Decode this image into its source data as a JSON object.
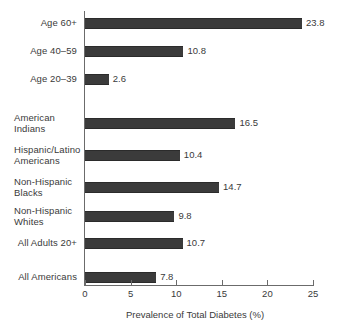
{
  "chart_data": {
    "type": "bar",
    "orientation": "horizontal",
    "title": "",
    "xlabel": "Prevalence of Total Diabetes (%)",
    "ylabel": "",
    "xlim": [
      0,
      25
    ],
    "xticks": [
      0,
      5,
      10,
      15,
      20,
      25
    ],
    "grid": false,
    "legend": false,
    "bar_color": "#3b3b3b",
    "categories": [
      "Age 60+",
      "Age 40–59",
      "Age 20–39",
      "American Indians",
      "Hispanic/Latino Americans",
      "Non-Hispanic Blacks",
      "Non-Hispanic Whites",
      "All Adults 20+",
      "All Americans"
    ],
    "values": [
      23.8,
      10.8,
      2.6,
      16.5,
      10.4,
      14.7,
      9.8,
      10.7,
      7.8
    ],
    "data_labels": [
      "23.8",
      "10.8",
      "2.6",
      "16.5",
      "10.4",
      "14.7",
      "9.8",
      "10.7",
      "7.8"
    ],
    "groups": [
      {
        "name": "age",
        "categories": [
          "Age 60+",
          "Age 40–59",
          "Age 20–39"
        ]
      },
      {
        "name": "race-ethnicity-and-adults",
        "categories": [
          "American Indians",
          "Hispanic/Latino Americans",
          "Non-Hispanic Blacks",
          "Non-Hispanic Whites",
          "All Adults 20+"
        ]
      },
      {
        "name": "overall",
        "categories": [
          "All Americans"
        ]
      }
    ]
  },
  "bars": [
    {
      "label": "Age 60+",
      "label_lines": "Age 60+",
      "value": 23.8,
      "value_text": "23.8",
      "top": 18,
      "two_line": false
    },
    {
      "label": "Age 40–59",
      "label_lines": "Age 40–59",
      "value": 10.8,
      "value_text": "10.8",
      "top": 46,
      "two_line": false
    },
    {
      "label": "Age 20–39",
      "label_lines": "Age 20–39",
      "value": 2.6,
      "value_text": "2.6",
      "top": 74,
      "two_line": false
    },
    {
      "label": "American Indians",
      "label_lines": "American\nIndians",
      "value": 16.5,
      "value_text": "16.5",
      "top": 118,
      "two_line": true
    },
    {
      "label": "Hispanic/Latino Americans",
      "label_lines": "Hispanic/Latino\nAmericans",
      "value": 10.4,
      "value_text": "10.4",
      "top": 150,
      "two_line": true
    },
    {
      "label": "Non-Hispanic Blacks",
      "label_lines": "Non-Hispanic\nBlacks",
      "value": 14.7,
      "value_text": "14.7",
      "top": 182,
      "two_line": true
    },
    {
      "label": "Non-Hispanic Whites",
      "label_lines": "Non-Hispanic\nWhites",
      "value": 9.8,
      "value_text": "9.8",
      "top": 211,
      "two_line": true
    },
    {
      "label": "All Adults 20+",
      "label_lines": "All Adults 20+",
      "value": 10.7,
      "value_text": "10.7",
      "top": 238,
      "two_line": false
    },
    {
      "label": "All Americans",
      "label_lines": "All Americans",
      "value": 7.8,
      "value_text": "7.8",
      "top": 272,
      "two_line": false
    }
  ],
  "axis": {
    "ticks": [
      {
        "value": 0,
        "label": "0"
      },
      {
        "value": 5,
        "label": "5"
      },
      {
        "value": 10,
        "label": "10"
      },
      {
        "value": 15,
        "label": "15"
      },
      {
        "value": 20,
        "label": "20"
      },
      {
        "value": 25,
        "label": "25"
      }
    ],
    "title": "Prevalence of Total Diabetes (%)"
  }
}
